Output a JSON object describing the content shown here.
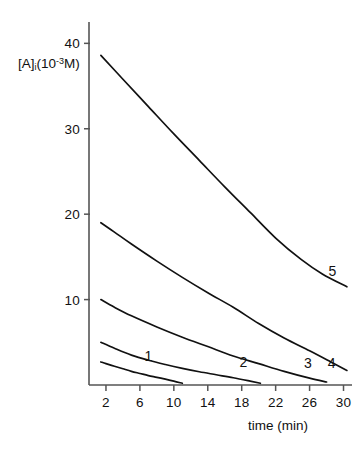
{
  "chart_data": {
    "type": "line",
    "title": "",
    "xlabel": "time (min)",
    "ylabel": "[A]i(10-3M)",
    "ylabel_parts": {
      "base": "[A]",
      "subscript": "i",
      "paren_open": "(10",
      "exponent": "-3",
      "unit": "M)"
    },
    "xlim": [
      0,
      31
    ],
    "ylim": [
      0,
      42.5
    ],
    "xticks": [
      2,
      6,
      10,
      14,
      18,
      22,
      26,
      30
    ],
    "xtick_labels": [
      "2",
      "6",
      "10",
      "14",
      "18",
      "22",
      "26",
      "30"
    ],
    "yticks": [
      10,
      20,
      30,
      40
    ],
    "ytick_labels": [
      "10",
      "20",
      "30",
      "40"
    ],
    "grid": false,
    "legend": "inline-curve-labels",
    "line_color": "#111111",
    "axis_color": "#555555",
    "background": "#ffffff",
    "series": [
      {
        "name": "1",
        "label": "1",
        "label_x": 7.0,
        "label_y": 3.4,
        "x": [
          1.4,
          2.0,
          3.0,
          4.0,
          5.0,
          6.0,
          7.0,
          8.0,
          9.0,
          10.0,
          11.0
        ],
        "values": [
          2.7,
          2.5,
          2.2,
          1.9,
          1.6,
          1.35,
          1.1,
          0.9,
          0.68,
          0.45,
          0.2
        ]
      },
      {
        "name": "2",
        "label": "2",
        "label_x": 18.2,
        "label_y": 2.7,
        "x": [
          1.4,
          3.0,
          5.0,
          7.0,
          9.0,
          11.0,
          13.0,
          15.0,
          17.0,
          19.0,
          20.2
        ],
        "values": [
          5.0,
          4.3,
          3.5,
          2.9,
          2.4,
          1.95,
          1.55,
          1.2,
          0.85,
          0.45,
          0.2
        ]
      },
      {
        "name": "3",
        "label": "3",
        "label_x": 25.8,
        "label_y": 2.6,
        "x": [
          1.4,
          3.0,
          5.0,
          8.0,
          11.0,
          14.0,
          17.0,
          20.0,
          23.0,
          26.0,
          28.0
        ],
        "values": [
          10.0,
          9.1,
          8.1,
          6.8,
          5.6,
          4.5,
          3.4,
          2.5,
          1.6,
          0.8,
          0.35
        ]
      },
      {
        "name": "4",
        "label": "4",
        "label_x": 28.6,
        "label_y": 2.6,
        "x": [
          1.4,
          3.0,
          5.0,
          8.0,
          11.0,
          14.0,
          17.0,
          20.0,
          23.0,
          26.0,
          28.5,
          30.4
        ],
        "values": [
          19.0,
          17.9,
          16.5,
          14.5,
          12.6,
          10.8,
          9.1,
          7.2,
          5.5,
          4.0,
          2.7,
          1.7
        ]
      },
      {
        "name": "5",
        "label": "5",
        "label_x": 28.7,
        "label_y": 13.3,
        "x": [
          1.4,
          4.0,
          7.0,
          10.0,
          13.0,
          16.0,
          19.0,
          22.0,
          25.0,
          27.5,
          30.4
        ],
        "values": [
          38.6,
          35.8,
          32.6,
          29.4,
          26.3,
          23.2,
          20.2,
          17.2,
          14.7,
          13.0,
          11.5
        ]
      }
    ]
  }
}
